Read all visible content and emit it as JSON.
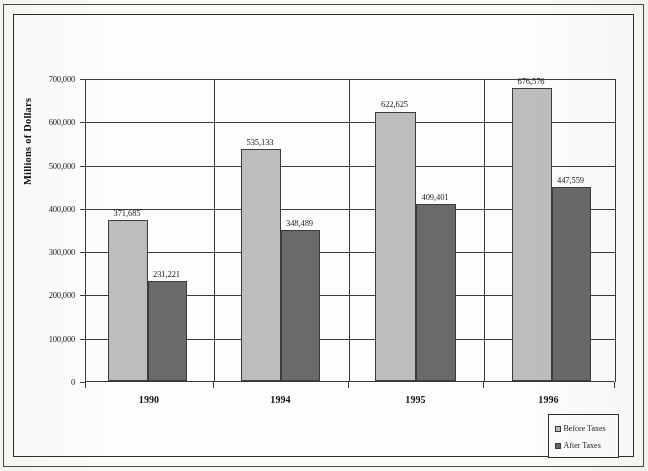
{
  "chart_data": {
    "type": "bar",
    "title": "",
    "subtitle": "",
    "xlabel": "",
    "ylabel": "Millions of Dollars",
    "categories": [
      "1990",
      "1994",
      "1995",
      "1996"
    ],
    "series": [
      {
        "name": "Before Taxes",
        "color": "#bdbdbd",
        "values": [
          371685,
          535133,
          622625,
          676576
        ],
        "labels": [
          "371,685",
          "535,133",
          "622,625",
          "676,576"
        ]
      },
      {
        "name": "After Taxes",
        "color": "#6a6a6a",
        "values": [
          231221,
          348489,
          409401,
          447559
        ],
        "labels": [
          "231,221",
          "348,489",
          "409,401",
          "447,559"
        ]
      }
    ],
    "ylim": [
      0,
      700000
    ],
    "ytick_values": [
      0,
      100000,
      200000,
      300000,
      400000,
      500000,
      600000,
      700000
    ],
    "ytick_labels": [
      "0",
      "100,000",
      "200,000",
      "300,000",
      "400,000",
      "500,000",
      "600,000",
      "700,000"
    ],
    "grid": "horizontal-and-group-separators",
    "legend_position": "bottom-right",
    "data_labels": true
  },
  "legend": {
    "items": [
      {
        "label": "Before Taxes",
        "color": "#bdbdbd"
      },
      {
        "label": "After Taxes",
        "color": "#6a6a6a"
      }
    ]
  },
  "axis": {
    "y_title": "Millions of Dollars"
  }
}
